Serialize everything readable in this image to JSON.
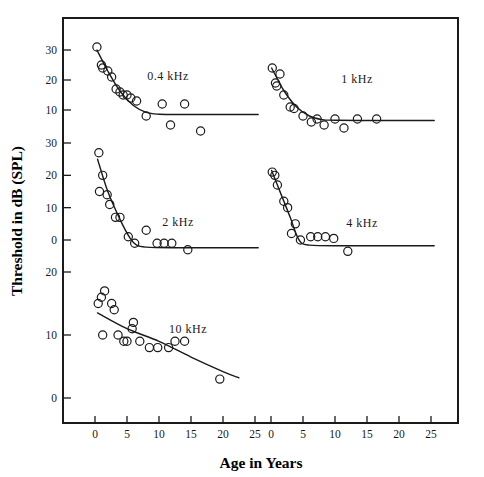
{
  "figure": {
    "xlabel": "Age in Years",
    "ylabel": "Threshold in dB (SPL)"
  },
  "chart_data": {
    "type": "scatter",
    "title": "",
    "xlabel": "Age in Years",
    "ylabel": "Threshold in dB (SPL)",
    "grid": false,
    "legend_position": "in-panel-annotation",
    "xlim": [
      -2,
      27
    ],
    "xticks": [
      0,
      5,
      10,
      15,
      20,
      25
    ],
    "layout": "2 columns x 3 rows of stacked panels sharing a common frame",
    "panels": [
      {
        "name": "0.4 kHz",
        "label": "0.4  kHz",
        "column": "left",
        "row": 1,
        "yticks": [
          10,
          20,
          30
        ],
        "ylim": [
          0,
          36
        ],
        "points": [
          {
            "x": 0.3,
            "y": 31
          },
          {
            "x": 1.0,
            "y": 25
          },
          {
            "x": 1.2,
            "y": 24
          },
          {
            "x": 2.0,
            "y": 23
          },
          {
            "x": 2.6,
            "y": 21
          },
          {
            "x": 3.3,
            "y": 17
          },
          {
            "x": 3.9,
            "y": 16
          },
          {
            "x": 4.4,
            "y": 15
          },
          {
            "x": 5.0,
            "y": 15
          },
          {
            "x": 5.6,
            "y": 14
          },
          {
            "x": 6.5,
            "y": 13
          },
          {
            "x": 8.0,
            "y": 8
          },
          {
            "x": 10.5,
            "y": 12
          },
          {
            "x": 11.8,
            "y": 5
          },
          {
            "x": 14.0,
            "y": 12
          },
          {
            "x": 16.5,
            "y": 3
          }
        ],
        "fit_curve": [
          {
            "x": 0.3,
            "y": 30
          },
          {
            "x": 2.0,
            "y": 23
          },
          {
            "x": 4.0,
            "y": 16
          },
          {
            "x": 6.0,
            "y": 11.5
          },
          {
            "x": 8.0,
            "y": 9.2
          },
          {
            "x": 10.0,
            "y": 8.6
          },
          {
            "x": 14.0,
            "y": 8.5
          },
          {
            "x": 20.0,
            "y": 8.5
          },
          {
            "x": 25.5,
            "y": 8.5
          }
        ]
      },
      {
        "name": "1 kHz",
        "label": "1  kHz",
        "column": "right",
        "row": 1,
        "yticks": [
          10,
          20,
          30
        ],
        "ylim": [
          0,
          36
        ],
        "points": [
          {
            "x": 0.2,
            "y": 24
          },
          {
            "x": 1.4,
            "y": 22
          },
          {
            "x": 0.7,
            "y": 19
          },
          {
            "x": 0.9,
            "y": 18
          },
          {
            "x": 2.0,
            "y": 15
          },
          {
            "x": 3.0,
            "y": 11
          },
          {
            "x": 3.6,
            "y": 10.5
          },
          {
            "x": 5.0,
            "y": 8
          },
          {
            "x": 6.3,
            "y": 6
          },
          {
            "x": 7.2,
            "y": 7
          },
          {
            "x": 8.3,
            "y": 5
          },
          {
            "x": 10.0,
            "y": 7
          },
          {
            "x": 11.4,
            "y": 4
          },
          {
            "x": 13.5,
            "y": 7
          },
          {
            "x": 16.5,
            "y": 7
          }
        ],
        "fit_curve": [
          {
            "x": 0.1,
            "y": 24
          },
          {
            "x": 2.0,
            "y": 16.5
          },
          {
            "x": 4.0,
            "y": 11
          },
          {
            "x": 6.0,
            "y": 8
          },
          {
            "x": 8.0,
            "y": 6.8
          },
          {
            "x": 10.0,
            "y": 6.6
          },
          {
            "x": 14.0,
            "y": 6.5
          },
          {
            "x": 20.0,
            "y": 6.5
          },
          {
            "x": 25.5,
            "y": 6.5
          }
        ]
      },
      {
        "name": "2 kHz",
        "label": "2  kHz",
        "column": "left",
        "row": 2,
        "yticks": [
          0,
          10,
          20,
          30
        ],
        "ylim": [
          -6,
          33
        ],
        "points": [
          {
            "x": 0.6,
            "y": 27
          },
          {
            "x": 1.2,
            "y": 20
          },
          {
            "x": 0.7,
            "y": 15
          },
          {
            "x": 1.9,
            "y": 14
          },
          {
            "x": 2.3,
            "y": 11
          },
          {
            "x": 3.2,
            "y": 7
          },
          {
            "x": 3.9,
            "y": 7
          },
          {
            "x": 5.2,
            "y": 1
          },
          {
            "x": 6.2,
            "y": -1
          },
          {
            "x": 8.0,
            "y": 3
          },
          {
            "x": 9.7,
            "y": -1
          },
          {
            "x": 10.8,
            "y": -1
          },
          {
            "x": 12.0,
            "y": -1
          },
          {
            "x": 14.5,
            "y": -3
          }
        ],
        "fit_curve": [
          {
            "x": 0.4,
            "y": 25
          },
          {
            "x": 2.0,
            "y": 15
          },
          {
            "x": 4.0,
            "y": 6
          },
          {
            "x": 5.5,
            "y": 0.5
          },
          {
            "x": 6.5,
            "y": -1.6
          },
          {
            "x": 8.0,
            "y": -2.2
          },
          {
            "x": 12.0,
            "y": -2.4
          },
          {
            "x": 18.0,
            "y": -2.4
          },
          {
            "x": 25.5,
            "y": -2.4
          }
        ]
      },
      {
        "name": "4 kHz",
        "label": "4  kHz",
        "column": "right",
        "row": 2,
        "yticks": [
          0,
          10,
          20,
          30
        ],
        "ylim": [
          -6,
          33
        ],
        "points": [
          {
            "x": 0.2,
            "y": 21
          },
          {
            "x": 0.6,
            "y": 20
          },
          {
            "x": 1.0,
            "y": 17
          },
          {
            "x": 2.0,
            "y": 12
          },
          {
            "x": 2.6,
            "y": 10
          },
          {
            "x": 3.8,
            "y": 5
          },
          {
            "x": 3.2,
            "y": 2
          },
          {
            "x": 4.6,
            "y": 0
          },
          {
            "x": 6.2,
            "y": 1
          },
          {
            "x": 7.3,
            "y": 1
          },
          {
            "x": 8.5,
            "y": 1
          },
          {
            "x": 9.8,
            "y": 0.5
          },
          {
            "x": 12.0,
            "y": -3.5
          }
        ],
        "fit_curve": [
          {
            "x": 0.1,
            "y": 21.5
          },
          {
            "x": 1.5,
            "y": 14.5
          },
          {
            "x": 3.0,
            "y": 7
          },
          {
            "x": 4.0,
            "y": 1.5
          },
          {
            "x": 4.8,
            "y": -1
          },
          {
            "x": 6.0,
            "y": -1.6
          },
          {
            "x": 10.0,
            "y": -1.8
          },
          {
            "x": 16.0,
            "y": -1.8
          },
          {
            "x": 25.5,
            "y": -1.8
          }
        ]
      },
      {
        "name": "10 kHz",
        "label": "10  kHz",
        "column": "left",
        "row": 3,
        "yticks": [
          0,
          10,
          20
        ],
        "ylim": [
          -4,
          24
        ],
        "points": [
          {
            "x": 0.5,
            "y": 15
          },
          {
            "x": 1.0,
            "y": 16
          },
          {
            "x": 1.5,
            "y": 17
          },
          {
            "x": 1.2,
            "y": 10
          },
          {
            "x": 2.6,
            "y": 15
          },
          {
            "x": 3.0,
            "y": 14
          },
          {
            "x": 3.6,
            "y": 10
          },
          {
            "x": 4.5,
            "y": 9
          },
          {
            "x": 5.0,
            "y": 9
          },
          {
            "x": 5.8,
            "y": 11
          },
          {
            "x": 6.0,
            "y": 12
          },
          {
            "x": 7.0,
            "y": 9
          },
          {
            "x": 8.5,
            "y": 8
          },
          {
            "x": 9.8,
            "y": 8
          },
          {
            "x": 11.5,
            "y": 8
          },
          {
            "x": 12.5,
            "y": 9
          },
          {
            "x": 14.0,
            "y": 9
          },
          {
            "x": 19.5,
            "y": 3
          }
        ],
        "fit_curve": [
          {
            "x": 0.4,
            "y": 13.5
          },
          {
            "x": 5.0,
            "y": 11
          },
          {
            "x": 10.0,
            "y": 9
          },
          {
            "x": 15.0,
            "y": 6.5
          },
          {
            "x": 20.0,
            "y": 4.2
          },
          {
            "x": 22.5,
            "y": 3.2
          }
        ]
      }
    ]
  }
}
